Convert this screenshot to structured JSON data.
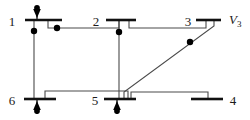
{
  "diagram": {
    "type": "single-line-diagram",
    "width": 250,
    "height": 120,
    "colors": {
      "background": "#ffffff",
      "bus": "#111111",
      "line": "#4a4a4a",
      "node": "#000000",
      "text": "#1a1a1a"
    },
    "buses": [
      {
        "id": "bus-1",
        "label": "1",
        "label_x": 12,
        "label_y": 26,
        "bar_x1": 25,
        "bar_x2": 62,
        "bar_y": 20
      },
      {
        "id": "bus-2",
        "label": "2",
        "label_x": 96,
        "label_y": 26,
        "bar_x1": 106,
        "bar_x2": 136,
        "bar_y": 20
      },
      {
        "id": "bus-3",
        "label": "3",
        "label_x": 188,
        "label_y": 26,
        "bar_x1": 196,
        "bar_x2": 221,
        "bar_y": 20
      },
      {
        "id": "bus-4",
        "label": "4",
        "label_x": 231,
        "label_y": 105,
        "bar_x1": 191,
        "bar_x2": 223,
        "bar_y": 99
      },
      {
        "id": "bus-5",
        "label": "5",
        "label_x": 95,
        "label_y": 105,
        "bar_x1": 104,
        "bar_x2": 136,
        "bar_y": 99
      },
      {
        "id": "bus-6",
        "label": "6",
        "label_x": 12,
        "label_y": 105,
        "bar_x1": 24,
        "bar_x2": 56,
        "bar_y": 99
      }
    ],
    "voltage_labels": [
      {
        "id": "v3",
        "symbol": "V",
        "subscript": "3",
        "x": 229,
        "y": 24
      }
    ],
    "branch_nodes": [
      {
        "id": "node-bus1-tap",
        "x": 34,
        "y": 31
      },
      {
        "id": "node-line-1-2",
        "x": 57,
        "y": 28
      },
      {
        "id": "node-bus2-tap",
        "x": 119,
        "y": 32
      },
      {
        "id": "node-line-3-5",
        "x": 190,
        "y": 42
      }
    ],
    "injections": [
      {
        "id": "injection-bus-1",
        "x": 37,
        "y": 8,
        "direction": "down",
        "attached_bus": "bus-1"
      },
      {
        "id": "injection-bus-6",
        "x": 37,
        "y": 112,
        "direction": "up",
        "attached_bus": "bus-6"
      },
      {
        "id": "injection-bus-5",
        "x": 117,
        "y": 112,
        "direction": "up",
        "attached_bus": "bus-5"
      }
    ],
    "branches": [
      {
        "id": "branch-1-2",
        "from": "bus-1",
        "to": "bus-2",
        "path": "M 48 20 L 48 28 L 119 28 L 119 20"
      },
      {
        "id": "branch-2-3",
        "from": "bus-2",
        "to": "bus-3",
        "path": "M 129 20 L 129 28 L 206 28 L 206 20"
      },
      {
        "id": "branch-1-6",
        "from": "bus-1",
        "to": "bus-6",
        "path": "M 34 20 L 34 99"
      },
      {
        "id": "branch-2-5",
        "from": "bus-2",
        "to": "bus-5",
        "path": "M 119 20 L 119 99"
      },
      {
        "id": "branch-3-5",
        "from": "bus-3",
        "to": "bus-5",
        "path": "M 214 20 L 214 26 L 124 92 L 124 99"
      },
      {
        "id": "branch-6-5",
        "from": "bus-6",
        "to": "bus-5",
        "path": "M 45 99 L 45 91 L 128 91 L 128 99"
      },
      {
        "id": "branch-5-4",
        "from": "bus-5",
        "to": "bus-4",
        "path": "M 131 99 L 131 92 L 208 92 L 208 99"
      }
    ]
  }
}
